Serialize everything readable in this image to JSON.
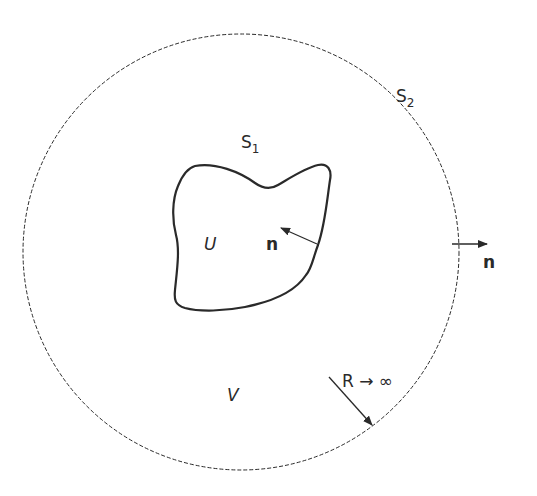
{
  "diagram": {
    "type": "domain-boundary-figure",
    "outer_surface": {
      "label": "S",
      "subscript": "2",
      "style": "dashed-circle",
      "center": [
        241,
        252
      ],
      "radius": 218
    },
    "inner_body": {
      "label": "U",
      "style": "solid-closed-curve"
    },
    "inner_surface": {
      "label": "S",
      "subscript": "1"
    },
    "region_between": {
      "label": "V"
    },
    "inner_normal": {
      "label": "n"
    },
    "outer_normal": {
      "label": "n"
    },
    "radius_annotation": {
      "label": "R → ∞"
    },
    "colors": {
      "stroke": "#2a2a2a",
      "background": "#ffffff"
    }
  }
}
